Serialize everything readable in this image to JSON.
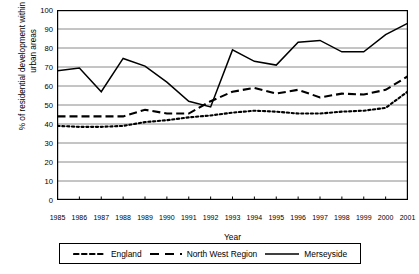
{
  "chart_data": {
    "type": "line",
    "title": "",
    "xlabel": "Year",
    "ylabel": "% of residential development within existing urban areas",
    "ylim": [
      0,
      100
    ],
    "ytick_step": 10,
    "yticks": [
      0,
      10,
      20,
      30,
      40,
      50,
      60,
      70,
      80,
      90,
      100
    ],
    "grid": true,
    "legend_position": "bottom",
    "x": [
      1985,
      1986,
      1987,
      1988,
      1989,
      1990,
      1991,
      1992,
      1993,
      1994,
      1995,
      1996,
      1997,
      1998,
      1999,
      2000,
      2001
    ],
    "categories": [
      "1985",
      "1986",
      "1987",
      "1988",
      "1989",
      "1990",
      "1991",
      "1992",
      "1993",
      "1994",
      "1995",
      "1996",
      "1997",
      "1998",
      "1999",
      "2000",
      "2001"
    ],
    "series": [
      {
        "name": "England",
        "style": "dotted",
        "color": "#000000",
        "values": [
          39,
          38.5,
          38.5,
          39,
          41,
          42,
          43.5,
          44.5,
          46,
          47,
          46.5,
          45.5,
          45.5,
          46.5,
          47,
          48.5,
          57
        ]
      },
      {
        "name": "North West Region",
        "style": "dashed",
        "color": "#000000",
        "values": [
          44,
          44,
          44,
          44,
          47.5,
          45.5,
          45.5,
          52,
          57,
          59,
          56,
          58,
          54,
          56,
          55.5,
          58,
          65
        ]
      },
      {
        "name": "Merseyside",
        "style": "solid",
        "color": "#000000",
        "values": [
          68,
          69.5,
          57,
          74.5,
          70.5,
          62,
          52,
          49,
          79,
          73,
          71,
          83,
          84,
          78,
          78,
          87,
          93
        ]
      }
    ]
  },
  "legend": {
    "entries": [
      {
        "label": "England",
        "style": "dotted"
      },
      {
        "label": "North West Region",
        "style": "dashed"
      },
      {
        "label": "Merseyside",
        "style": "solid"
      }
    ]
  },
  "axes": {
    "x_title": "Year",
    "y_title": "% of residential development within existing urban areas"
  }
}
